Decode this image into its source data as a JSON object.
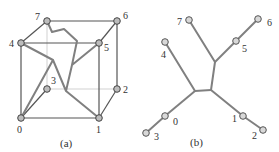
{
  "diagram": {
    "panel_a": {
      "caption": "(a)",
      "type": "cube",
      "nodes": [
        {
          "id": "0",
          "label": "0",
          "x": 21,
          "y": 118,
          "lx": 17,
          "ly": 133
        },
        {
          "id": "1",
          "label": "1",
          "x": 99,
          "y": 118,
          "lx": 96,
          "ly": 133
        },
        {
          "id": "2",
          "label": "2",
          "x": 117,
          "y": 89,
          "lx": 123,
          "ly": 93
        },
        {
          "id": "3",
          "label": "3",
          "x": 47,
          "y": 89,
          "lx": 51,
          "ly": 84
        },
        {
          "id": "4",
          "label": "4",
          "x": 21,
          "y": 43,
          "lx": 9,
          "ly": 47
        },
        {
          "id": "5",
          "label": "5",
          "x": 99,
          "y": 43,
          "lx": 104,
          "ly": 51
        },
        {
          "id": "6",
          "label": "6",
          "x": 117,
          "y": 21,
          "lx": 123,
          "ly": 19
        },
        {
          "id": "7",
          "label": "7",
          "x": 47,
          "y": 21,
          "lx": 35,
          "ly": 20
        }
      ],
      "front_edges": [
        [
          "0",
          "1"
        ],
        [
          "0",
          "4"
        ],
        [
          "4",
          "5"
        ],
        [
          "5",
          "1"
        ],
        [
          "4",
          "7"
        ],
        [
          "5",
          "6"
        ],
        [
          "1",
          "2"
        ],
        [
          "0",
          "3"
        ],
        [
          "7",
          "6"
        ],
        [
          "6",
          "2"
        ]
      ],
      "back_edges": [
        [
          "3",
          "2"
        ],
        [
          "7",
          "3"
        ]
      ],
      "embedded_tree_path": "M47,21 L52,32 L64,29 L77,41 L72,65 L66,91 M72,65 L99,43 M21,43 L53,60 L66,91 L99,118 M53,60 L21,118"
    },
    "panel_b": {
      "caption": "(b)",
      "type": "tree",
      "nodes": [
        {
          "id": "0",
          "label": "0",
          "x": 165,
          "y": 116,
          "lx": 173,
          "ly": 125
        },
        {
          "id": "1",
          "label": "1",
          "x": 243,
          "y": 116,
          "lx": 232,
          "ly": 122
        },
        {
          "id": "2",
          "label": "2",
          "x": 263,
          "y": 130,
          "lx": 252,
          "ly": 139
        },
        {
          "id": "3",
          "label": "3",
          "x": 146,
          "y": 133,
          "lx": 154,
          "ly": 140
        },
        {
          "id": "4",
          "label": "4",
          "x": 165,
          "y": 42,
          "lx": 161,
          "ly": 58
        },
        {
          "id": "5",
          "label": "5",
          "x": 236,
          "y": 41,
          "lx": 242,
          "ly": 52
        },
        {
          "id": "6",
          "label": "6",
          "x": 258,
          "y": 19,
          "lx": 267,
          "ly": 26
        },
        {
          "id": "7",
          "label": "7",
          "x": 189,
          "y": 20,
          "lx": 177,
          "ly": 25
        }
      ],
      "junctions": [
        {
          "id": "J1",
          "x": 215,
          "y": 62
        },
        {
          "id": "J2",
          "x": 211,
          "y": 90
        },
        {
          "id": "J3",
          "x": 195,
          "y": 91
        }
      ],
      "edges": [
        [
          "7",
          "J1"
        ],
        [
          "5",
          "J1"
        ],
        [
          "6",
          "5"
        ],
        [
          "J1",
          "J2"
        ],
        [
          "J2",
          "J3"
        ],
        [
          "4",
          "J3"
        ],
        [
          "J3",
          "0"
        ],
        [
          "0",
          "3"
        ],
        [
          "J2",
          "1"
        ],
        [
          "1",
          "2"
        ]
      ]
    }
  }
}
